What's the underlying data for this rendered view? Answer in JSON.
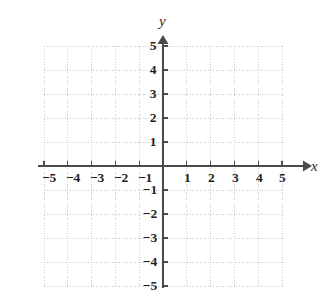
{
  "figure": {
    "kind": "cartesian-coordinate-plane",
    "background_color": "#ffffff"
  },
  "axes": {
    "x": {
      "label": "x",
      "arrow": "right"
    },
    "y": {
      "label": "y",
      "arrow": "up"
    },
    "color": "#4a4a4a",
    "grid_color": "#c9c9c9"
  },
  "chart_data": {
    "type": "scatter",
    "title": "",
    "subtitle": "",
    "xlabel": "x",
    "ylabel": "y",
    "xlim": [
      -5,
      5
    ],
    "ylim": [
      -5,
      5
    ],
    "xticks": [
      -5,
      -4,
      -3,
      -2,
      -1,
      1,
      2,
      3,
      4,
      5
    ],
    "yticks": [
      5,
      4,
      3,
      2,
      1,
      -1,
      -2,
      -3,
      -4,
      -5
    ],
    "xtick_labels": [
      "−5",
      "−4",
      "−3",
      "−2",
      "−1",
      "1",
      "2",
      "3",
      "4",
      "5"
    ],
    "ytick_labels": [
      "5",
      "4",
      "3",
      "2",
      "1",
      "−1",
      "−2",
      "−3",
      "−4",
      "−5"
    ],
    "grid": true,
    "grid_style": "dotted",
    "legend": false,
    "legend_position": "none",
    "series": [],
    "x": [],
    "values": [],
    "annotations": []
  },
  "x_tick_labels": [
    {
      "text": "−5",
      "left": 49,
      "top": 178
    },
    {
      "text": "−4",
      "left": 73,
      "top": 178
    },
    {
      "text": "−3",
      "left": 97,
      "top": 178
    },
    {
      "text": "−2",
      "left": 121,
      "top": 178
    },
    {
      "text": "−1",
      "left": 145,
      "top": 178
    },
    {
      "text": "1",
      "left": 187,
      "top": 178
    },
    {
      "text": "2",
      "left": 211,
      "top": 178
    },
    {
      "text": "3",
      "left": 235,
      "top": 178
    },
    {
      "text": "4",
      "left": 259,
      "top": 178
    },
    {
      "text": "5",
      "left": 282,
      "top": 178
    }
  ],
  "y_tick_labels": [
    {
      "text": "5",
      "left": 153,
      "top": 46
    },
    {
      "text": "4",
      "left": 153,
      "top": 70
    },
    {
      "text": "3",
      "left": 153,
      "top": 94
    },
    {
      "text": "2",
      "left": 153,
      "top": 118
    },
    {
      "text": "1",
      "left": 153,
      "top": 142
    },
    {
      "text": "−1",
      "left": 150,
      "top": 190
    },
    {
      "text": "−2",
      "left": 150,
      "top": 214
    },
    {
      "text": "−3",
      "left": 150,
      "top": 238
    },
    {
      "text": "−4",
      "left": 150,
      "top": 262
    },
    {
      "text": "−5",
      "left": 150,
      "top": 286
    }
  ]
}
